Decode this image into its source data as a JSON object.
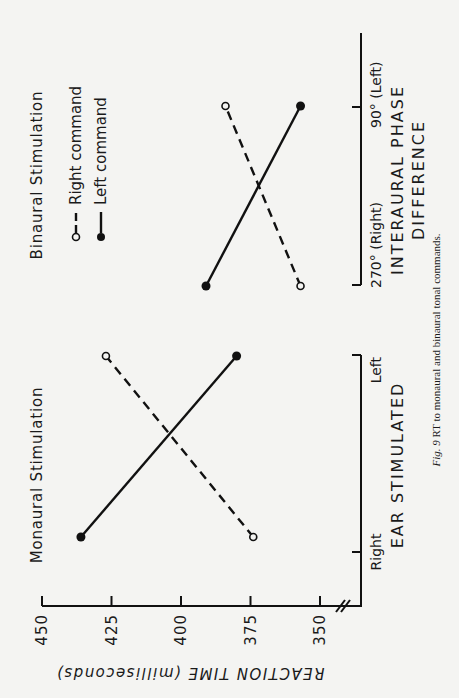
{
  "figure": {
    "caption": "Fig. 9 RT to monaural and binaural tonal commands.",
    "y_axis_label": "REACTION TIME (milliseconds)",
    "y_ticks": [
      "450",
      "425",
      "400",
      "375",
      "350"
    ],
    "legend": {
      "right_command": "Right command",
      "left_command": "Left command"
    },
    "panels": [
      {
        "title": "Monaural Stimulation",
        "x_axis_label": "EAR STIMULATED",
        "x_ticks": [
          "Right",
          "Left"
        ]
      },
      {
        "title": "Binaural Stimulation",
        "x_axis_label_line1": "INTERAURAL PHASE",
        "x_axis_label_line2": "DIFFERENCE",
        "x_ticks": [
          "270° (Right)",
          "90° (Left)"
        ]
      }
    ]
  },
  "chart_data": [
    {
      "type": "line",
      "title": "Monaural Stimulation",
      "xlabel": "EAR STIMULATED",
      "ylabel": "REACTION TIME (milliseconds)",
      "categories": [
        "Right",
        "Left"
      ],
      "ylim": [
        340,
        450
      ],
      "y_ticks": [
        350,
        375,
        400,
        425,
        450
      ],
      "axis_break": true,
      "grid": false,
      "series": [
        {
          "name": "Right command",
          "marker": "open-circle",
          "linestyle": "dashed",
          "values": [
            374,
            427
          ]
        },
        {
          "name": "Left command",
          "marker": "filled-circle",
          "linestyle": "solid",
          "values": [
            436,
            380
          ]
        }
      ]
    },
    {
      "type": "line",
      "title": "Binaural Stimulation",
      "xlabel": "INTERAURAL PHASE DIFFERENCE",
      "ylabel": "REACTION TIME (milliseconds)",
      "categories": [
        "270° (Right)",
        "90° (Left)"
      ],
      "ylim": [
        340,
        450
      ],
      "y_ticks": [
        350,
        375,
        400,
        425,
        450
      ],
      "grid": false,
      "legend_position": "top-right (rotated figure)",
      "series": [
        {
          "name": "Right command",
          "marker": "open-circle",
          "linestyle": "dashed",
          "values": [
            357,
            384
          ]
        },
        {
          "name": "Left command",
          "marker": "filled-circle",
          "linestyle": "solid",
          "values": [
            391,
            357
          ]
        }
      ]
    }
  ]
}
